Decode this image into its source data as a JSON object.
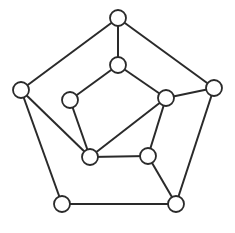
{
  "diagram": {
    "type": "undirected-graph",
    "node_radius": 8,
    "stroke_color": "#2a2a2a",
    "fill_color": "#ffffff",
    "nodes": [
      {
        "id": "outer-top",
        "x": 118,
        "y": 18
      },
      {
        "id": "outer-left",
        "x": 21,
        "y": 90
      },
      {
        "id": "outer-right",
        "x": 214,
        "y": 88
      },
      {
        "id": "outer-bottom-left",
        "x": 62,
        "y": 204
      },
      {
        "id": "outer-bottom-right",
        "x": 176,
        "y": 204
      },
      {
        "id": "inner-top",
        "x": 118,
        "y": 65
      },
      {
        "id": "inner-left",
        "x": 70,
        "y": 100
      },
      {
        "id": "inner-right",
        "x": 166,
        "y": 98
      },
      {
        "id": "inner-bottom-left",
        "x": 90,
        "y": 157
      },
      {
        "id": "inner-bottom-right",
        "x": 148,
        "y": 156
      }
    ],
    "edges": [
      [
        "outer-top",
        "outer-left"
      ],
      [
        "outer-top",
        "outer-right"
      ],
      [
        "outer-left",
        "outer-bottom-left"
      ],
      [
        "outer-right",
        "outer-bottom-right"
      ],
      [
        "outer-bottom-left",
        "outer-bottom-right"
      ],
      [
        "outer-top",
        "inner-top"
      ],
      [
        "inner-top",
        "inner-left"
      ],
      [
        "inner-top",
        "inner-right"
      ],
      [
        "inner-left",
        "inner-bottom-left"
      ],
      [
        "inner-right",
        "inner-bottom-left"
      ],
      [
        "inner-right",
        "inner-bottom-right"
      ],
      [
        "inner-right",
        "outer-right"
      ],
      [
        "inner-bottom-left",
        "inner-bottom-right"
      ],
      [
        "outer-left",
        "inner-bottom-left"
      ],
      [
        "inner-bottom-right",
        "outer-bottom-right"
      ]
    ]
  }
}
